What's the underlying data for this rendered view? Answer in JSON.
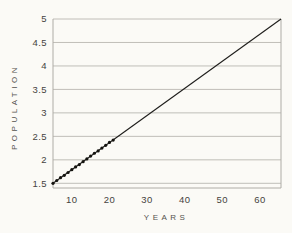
{
  "chart_data": {
    "type": "line",
    "title": "",
    "xlabel": "YEARS",
    "ylabel": "POPULATION",
    "xlim": [
      5,
      65.6
    ],
    "ylim": [
      1.4,
      5.0
    ],
    "grid": "horizontal",
    "legend": "none",
    "xticks": [
      {
        "value": 10,
        "label": "10"
      },
      {
        "value": 20,
        "label": "20"
      },
      {
        "value": 30,
        "label": "30"
      },
      {
        "value": 40,
        "label": "40"
      },
      {
        "value": 50,
        "label": "50"
      },
      {
        "value": 60,
        "label": "60"
      }
    ],
    "yticks": [
      {
        "value": 1.5,
        "label": "1.5"
      },
      {
        "value": 2.0,
        "label": "2"
      },
      {
        "value": 2.5,
        "label": "2.5"
      },
      {
        "value": 3.0,
        "label": "3"
      },
      {
        "value": 3.5,
        "label": "3.5"
      },
      {
        "value": 4.0,
        "label": "4"
      },
      {
        "value": 4.5,
        "label": "4.5"
      },
      {
        "value": 5.0,
        "label": "5"
      }
    ],
    "series": [
      {
        "name": "trend-line",
        "type": "line",
        "points": [
          [
            5,
            1.5
          ],
          [
            65.6,
            5.0
          ]
        ]
      },
      {
        "name": "observed-points",
        "type": "scatter",
        "points": [
          [
            5,
            1.5
          ],
          [
            6,
            1.56
          ],
          [
            7,
            1.62
          ],
          [
            8,
            1.67
          ],
          [
            9,
            1.73
          ],
          [
            10,
            1.79
          ],
          [
            11,
            1.85
          ],
          [
            12,
            1.9
          ],
          [
            13,
            1.96
          ],
          [
            14,
            2.02
          ],
          [
            15,
            2.08
          ],
          [
            16,
            2.14
          ],
          [
            17,
            2.19
          ],
          [
            18,
            2.25
          ],
          [
            19,
            2.31
          ],
          [
            20,
            2.37
          ],
          [
            21,
            2.42
          ]
        ]
      }
    ],
    "colors": {
      "line": "#1e1d1b",
      "point": "#14130f",
      "grid": "#b9b7b1",
      "axis": "#aeaca6",
      "text": "#454340",
      "background": "#fbfaf6"
    }
  }
}
